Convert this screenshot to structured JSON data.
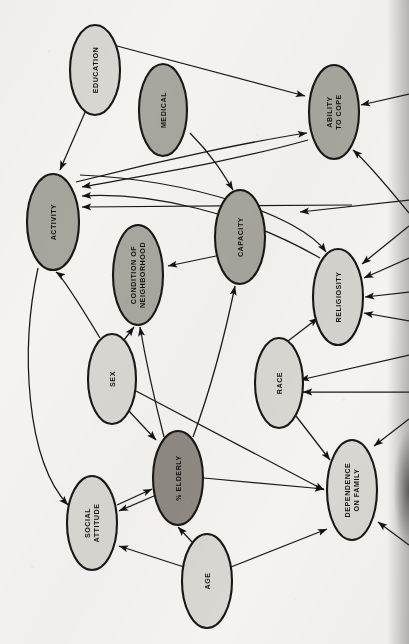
{
  "figure": {
    "kind": "causal-path-diagram",
    "orientation": "rotated-90-ccw",
    "background_color": "#f4f3f0",
    "stroke_color": "#1a1816"
  },
  "legend": {
    "shade_dark_label": "dark shaded node",
    "shade_medium_label": "medium shaded node",
    "shade_light_label": "light shaded node"
  },
  "chart_data": {
    "type": "diagram",
    "title": "",
    "nodes": [
      {
        "id": "education",
        "label": "EDUCATION",
        "lines": [
          "EDUCATION"
        ],
        "shade": "light",
        "fill": "#d9d7d2",
        "cx": 95,
        "cy": 70,
        "rx": 25,
        "ry": 45
      },
      {
        "id": "medical",
        "label": "MEDICAL",
        "lines": [
          "MEDICAL"
        ],
        "shade": "medium",
        "fill": "#a9a69f",
        "cx": 163,
        "cy": 110,
        "rx": 24,
        "ry": 46
      },
      {
        "id": "ability",
        "label": "ABILITY TO COPE",
        "lines": [
          "ABILITY",
          "TO COPE"
        ],
        "shade": "medium",
        "fill": "#a9a69f",
        "cx": 334,
        "cy": 112,
        "rx": 25,
        "ry": 47
      },
      {
        "id": "activity",
        "label": "ACTIVITY",
        "lines": [
          "ACTIVITY"
        ],
        "shade": "medium",
        "fill": "#a8a59e",
        "cx": 53,
        "cy": 222,
        "rx": 26,
        "ry": 48
      },
      {
        "id": "condition",
        "label": "CONDITION OF NEIGHBORHOOD",
        "lines": [
          "CONDITION OF",
          "NEIGHBORHOOD"
        ],
        "shade": "medium",
        "fill": "#a9a69f",
        "cx": 138,
        "cy": 275,
        "rx": 25,
        "ry": 50
      },
      {
        "id": "capacity",
        "label": "CAPACITY",
        "lines": [
          "CAPACITY"
        ],
        "shade": "medium",
        "fill": "#a8a59e",
        "cx": 240,
        "cy": 237,
        "rx": 25,
        "ry": 47
      },
      {
        "id": "religiosity",
        "label": "RELIGIOSITY",
        "lines": [
          "RELIGIOSITY"
        ],
        "shade": "light",
        "fill": "#d4d2cc",
        "cx": 338,
        "cy": 297,
        "rx": 25,
        "ry": 48
      },
      {
        "id": "sex",
        "label": "SEX",
        "lines": [
          "SEX"
        ],
        "shade": "light",
        "fill": "#d9d7d2",
        "cx": 112,
        "cy": 379,
        "rx": 24,
        "ry": 45
      },
      {
        "id": "race",
        "label": "RACE",
        "lines": [
          "RACE"
        ],
        "shade": "light",
        "fill": "#d9d7d2",
        "cx": 279,
        "cy": 383,
        "rx": 24,
        "ry": 45
      },
      {
        "id": "elderly",
        "label": "% ELDERLY",
        "lines": [
          "% ELDERLY"
        ],
        "shade": "dark",
        "fill": "#8e8a83",
        "cx": 178,
        "cy": 478,
        "rx": 25,
        "ry": 47
      },
      {
        "id": "social",
        "label": "SOCIAL ATTITUDE",
        "lines": [
          "SOCIAL",
          "ATTITUDE"
        ],
        "shade": "light",
        "fill": "#d9d7d2",
        "cx": 92,
        "cy": 523,
        "rx": 25,
        "ry": 47
      },
      {
        "id": "age",
        "label": "AGE",
        "lines": [
          "AGE"
        ],
        "shade": "light",
        "fill": "#d9d7d2",
        "cx": 207,
        "cy": 581,
        "rx": 25,
        "ry": 47
      },
      {
        "id": "dependence",
        "label": "DEPENDENCE ON FAMILY",
        "lines": [
          "DEPENDENCE",
          "ON FAMILY"
        ],
        "shade": "light",
        "fill": "#d9d7d2",
        "cx": 352,
        "cy": 490,
        "rx": 25,
        "ry": 50
      }
    ],
    "edges": [
      {
        "from": "education",
        "to": "ability"
      },
      {
        "from": "education",
        "to": "activity"
      },
      {
        "from": "capacity",
        "to": "activity"
      },
      {
        "from": "capacity",
        "to": "condition"
      },
      {
        "from": "ability",
        "to": "activity"
      },
      {
        "from": "religiosity",
        "to": "activity"
      },
      {
        "from": "medical",
        "to": "capacity"
      },
      {
        "from": "sex",
        "to": "activity"
      },
      {
        "from": "sex",
        "to": "condition"
      },
      {
        "from": "sex",
        "to": "elderly"
      },
      {
        "from": "sex",
        "to": "dependence"
      },
      {
        "from": "race",
        "to": "religiosity"
      },
      {
        "from": "race",
        "to": "dependence"
      },
      {
        "from": "elderly",
        "to": "capacity"
      },
      {
        "from": "elderly",
        "to": "condition"
      },
      {
        "from": "elderly",
        "to": "social"
      },
      {
        "from": "elderly",
        "to": "dependence"
      },
      {
        "from": "social",
        "to": "elderly"
      },
      {
        "from": "age",
        "to": "elderly"
      },
      {
        "from": "age",
        "to": "social"
      },
      {
        "from": "age",
        "to": "dependence"
      },
      {
        "from": "activity",
        "to": "ability"
      },
      {
        "from": "offscreen-right",
        "to": "ability"
      },
      {
        "from": "offscreen-right",
        "to": "religiosity"
      },
      {
        "from": "offscreen-right",
        "to": "dependence"
      }
    ],
    "node_count": 13,
    "edge_count": 25
  }
}
